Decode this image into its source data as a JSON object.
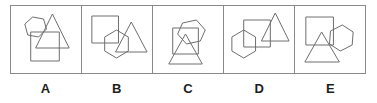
{
  "figure": {
    "type": "shape-overlap-answer-options",
    "frame_color": "#8a8a8a",
    "shape_stroke_color": "#6e6e6e",
    "label_color": "#1d1d1d",
    "background_color": "#ffffff",
    "panel_count": 5
  },
  "options": [
    {
      "label": "A",
      "shapes": [
        {
          "name": "hexagon",
          "points": "14,18 22,11 33,13 36,23 28,31 17,29"
        },
        {
          "name": "triangle",
          "points": "42,8 59,42 25,42"
        },
        {
          "name": "square",
          "points": "20,26 49,26 49,55 20,55"
        }
      ]
    },
    {
      "label": "B",
      "shapes": [
        {
          "name": "square",
          "points": "10,10 37,10 37,37 10,37"
        },
        {
          "name": "hexagon",
          "points": "23,31 35,24 47,31 47,45 35,52 23,45"
        },
        {
          "name": "triangle",
          "points": "50,16 66,46 34,46"
        }
      ]
    },
    {
      "label": "C",
      "shapes": [
        {
          "name": "hexagon",
          "points": "30,17 44,14 53,24 48,35 34,38 25,28"
        },
        {
          "name": "square",
          "points": "20,22 46,22 46,48 20,48"
        },
        {
          "name": "triangle",
          "points": "33,28 50,58 16,58"
        }
      ]
    },
    {
      "label": "D",
      "shapes": [
        {
          "name": "hexagon",
          "points": "8,31 20,24 32,31 32,45 20,52 8,45"
        },
        {
          "name": "square",
          "points": "20,14 47,14 47,41 20,41"
        },
        {
          "name": "triangle",
          "points": "52,7 66,35 38,35"
        }
      ]
    },
    {
      "label": "E",
      "shapes": [
        {
          "name": "square",
          "points": "11,11 39,11 39,39 11,39"
        },
        {
          "name": "hexagon",
          "points": "36,25 48,19 59,26 58,39 46,45 35,38"
        },
        {
          "name": "triangle",
          "points": "27,26 45,56 10,56"
        }
      ]
    }
  ]
}
